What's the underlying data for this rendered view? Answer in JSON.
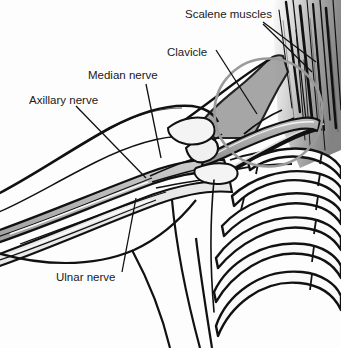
{
  "figure": {
    "background_color": "#fdfdfd",
    "line_color": "#111111",
    "fill_light": "#f2f2f2",
    "fill_mid": "#bdbdbd",
    "fill_dark": "#8a8a8a",
    "highlight_circle_color": "#9a9a9a"
  },
  "labels": {
    "scalene_muscles": "Scalene muscles",
    "clavicle": "Clavicle",
    "median_nerve": "Median nerve",
    "axillary_nerve": "Axillary nerve",
    "ulnar_nerve": "Ulnar nerve"
  },
  "structures": {
    "highlight_circle": "highlight-circle",
    "scalene_muscle_fibers": "scalene-muscle-fibers",
    "clavicle_bone": "clavicle-bone",
    "rib_cage": "rib-cage",
    "arm_outline": "arm-outline",
    "nerve_bundles": "nerve-bundles",
    "torso_outline": "torso-outline"
  }
}
